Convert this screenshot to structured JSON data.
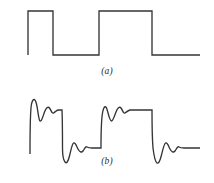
{
  "figure": {
    "background_color": "#ffffff",
    "stroke_color": "#353535",
    "stroke_width": 1.35,
    "width": 214,
    "height": 183
  },
  "panels": [
    {
      "id": "a",
      "caption": "(a)",
      "description": "ideal square wave, two full pulses, sharp transitions",
      "name": "ideal-square-wave"
    },
    {
      "id": "b",
      "caption": "(b)",
      "description": "square wave with Gibbs ringing: overshoot and damped oscillation after each edge",
      "name": "ringing-square-wave"
    }
  ],
  "chart_data": [
    {
      "type": "line",
      "id": "panel-a-waveform",
      "title": "(a)",
      "xlabel": "",
      "ylabel": "",
      "grid": false,
      "legend": null,
      "xlim": [
        0,
        214
      ],
      "ylim": [
        0,
        92
      ],
      "levels": {
        "high_y": 11,
        "low_y": 55
      },
      "edges_x": [
        28,
        53,
        99,
        152
      ],
      "x_start": 28,
      "x_end": 200,
      "path": "M28,55 L28,11 L53,11 L53,55 L99,55 L99,11 L152,11 L152,55 L200,55",
      "points": [
        {
          "x": 28,
          "y": 55
        },
        {
          "x": 28,
          "y": 11
        },
        {
          "x": 53,
          "y": 11
        },
        {
          "x": 53,
          "y": 55
        },
        {
          "x": 99,
          "y": 55
        },
        {
          "x": 99,
          "y": 11
        },
        {
          "x": 152,
          "y": 11
        },
        {
          "x": 152,
          "y": 55
        },
        {
          "x": 200,
          "y": 55
        }
      ]
    },
    {
      "type": "line",
      "id": "panel-b-waveform",
      "title": "(b)",
      "xlabel": "",
      "ylabel": "",
      "grid": false,
      "legend": null,
      "xlim": [
        0,
        214
      ],
      "ylim": [
        0,
        91
      ],
      "levels": {
        "high_y": 18,
        "low_y": 56
      },
      "edges_x": [
        30,
        62,
        101,
        152
      ],
      "x_start": 30,
      "x_end": 200,
      "overshoot_amplitude": 9,
      "path": "M30,62 C30,42 30,20 31.5,12 C33,6 35,6 36.5,12 C38,18 38.5,28 40,29 C41.5,30 43,24 44.5,20 C46,16 48,14 49.5,16 C51,18 52,22 53.5,21 C55,20 56.5,18.5 58,18 L62,18 L62,18 C62.5,30 62.5,44 62.5,56 C62.5,62 63.5,68 65,70 C66.5,72 68,70 69.5,64 C71,58 72,52 73.5,51 C75,50 76.5,54 78,57 C79.5,60 81.5,61 83,59 C84.5,57 85.5,54 87,55 C88.5,56 90,56 92,56 L101,56 C101,44 101,30 102.5,21 C104,13 106,13 107.5,19 C109,25 110,29 111.5,29 C113,29 114.5,24 116,20 C117.5,16 119.5,14 121,16 C122.5,18 123.5,22 125,21 C126.5,20 128,18.5 130,18 L152,18 C152,30 152,44 153,56 C154,64 155.5,70 157,71 C158.5,72 160,69 161.5,63 C163,57 164,52 165.5,51 C167,50 168.5,54 170,57 C171.5,60 173.5,61 175,59 C176.5,57 177.5,54 179,55 C180.5,56 182,56 184,56 L200,56",
      "segments": [
        {
          "name": "rise-1",
          "x": 30,
          "from_y": 62,
          "to_y": 12,
          "ringing": true
        },
        {
          "name": "plateau-high-1",
          "x_from": 58,
          "x_to": 62,
          "y": 18
        },
        {
          "name": "fall-1",
          "x": 62,
          "from_y": 18,
          "to_y": 70,
          "ringing": true
        },
        {
          "name": "plateau-low-1",
          "x_from": 92,
          "x_to": 101,
          "y": 56
        },
        {
          "name": "rise-2",
          "x": 101,
          "from_y": 56,
          "to_y": 21,
          "ringing": true
        },
        {
          "name": "plateau-high-2",
          "x_from": 130,
          "x_to": 152,
          "y": 18
        },
        {
          "name": "fall-2",
          "x": 152,
          "from_y": 18,
          "to_y": 71,
          "ringing": true
        },
        {
          "name": "plateau-low-2",
          "x_from": 184,
          "x_to": 200,
          "y": 56
        }
      ]
    }
  ]
}
